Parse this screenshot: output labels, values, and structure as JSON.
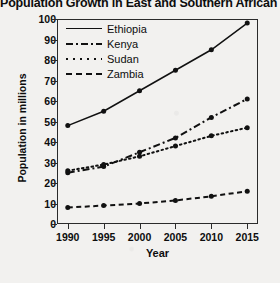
{
  "chart_data": {
    "type": "line",
    "title": "Population Growth in East and Southern African Nations",
    "xlabel": "Year",
    "ylabel": "Population in millions",
    "x": [
      1990,
      1995,
      2000,
      2005,
      2010,
      2015
    ],
    "xtick_labels": [
      "1990",
      "1995",
      "2000",
      "2005",
      "2010",
      "2015"
    ],
    "ytick_labels": [
      "0",
      "10",
      "20",
      "30",
      "40",
      "50",
      "60",
      "70",
      "80",
      "90",
      "100"
    ],
    "ytick_values": [
      0,
      10,
      20,
      30,
      40,
      50,
      60,
      70,
      80,
      90,
      100
    ],
    "ylim": [
      0,
      100
    ],
    "xlim": [
      1988.5,
      2016.5
    ],
    "grid": false,
    "legend_position": "top-left-inside",
    "marker": "filled-circle",
    "series": [
      {
        "name": "Ethiopia",
        "linestyle": "solid",
        "color": "#111111",
        "values": [
          48,
          55,
          65,
          75,
          85,
          98
        ]
      },
      {
        "name": "Kenya",
        "linestyle": "dash-dot",
        "color": "#111111",
        "values": [
          25,
          28,
          35,
          42,
          52,
          61
        ]
      },
      {
        "name": "Sudan",
        "linestyle": "dotted",
        "color": "#111111",
        "values": [
          26,
          29,
          33,
          38,
          43,
          47
        ]
      },
      {
        "name": "Zambia",
        "linestyle": "dashed",
        "color": "#111111",
        "values": [
          8,
          9,
          10,
          11.5,
          13.5,
          16
        ]
      }
    ]
  }
}
